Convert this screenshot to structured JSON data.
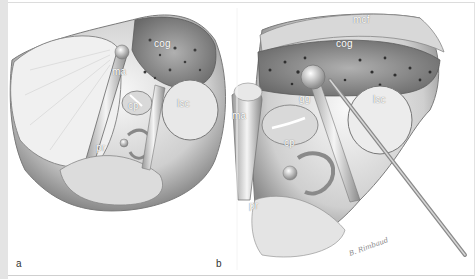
{
  "figure": {
    "panels": [
      {
        "id": "a",
        "letter": "a",
        "labels": {
          "ma": "ma",
          "cog": "cog",
          "cp": "cp",
          "lsc": "lsc",
          "pr": "pr"
        }
      },
      {
        "id": "b",
        "letter": "b",
        "labels": {
          "mcf": "mcf",
          "cog": "cog",
          "gg": "gg",
          "lsc": "lsc",
          "ma": "ma",
          "cp": "cp",
          "pr": "pr"
        },
        "signature": "B. Rimbaud"
      }
    ],
    "colors": {
      "background": "#ffffff",
      "left_strip": "#e4e4e4",
      "bone_light": "#f2f2f2",
      "bone_mid": "#c8c8c8",
      "bone_dark": "#6e6e6e",
      "label": "#ffffff"
    }
  }
}
